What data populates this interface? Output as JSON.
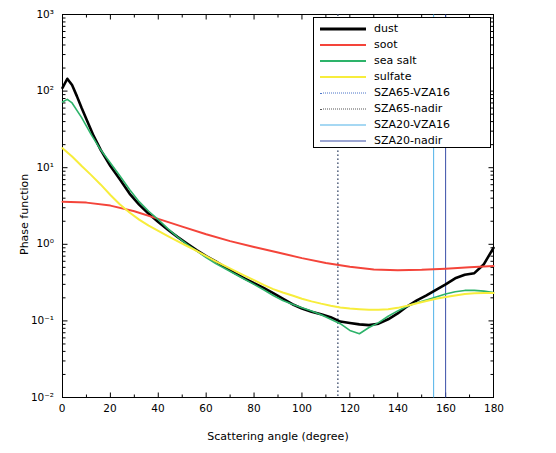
{
  "chart_data": {
    "type": "line",
    "title": "",
    "xlabel": "Scattering angle (degree)",
    "ylabel": "Phase function",
    "xlim": [
      0,
      180
    ],
    "ylim": [
      0.01,
      1000
    ],
    "yscale": "log",
    "xticks": [
      0,
      20,
      40,
      60,
      80,
      100,
      120,
      140,
      160,
      180
    ],
    "xtick_labels": [
      "0",
      "20",
      "40",
      "60",
      "80",
      "100",
      "120",
      "140",
      "160",
      "180"
    ],
    "yticks": [
      0.01,
      0.1,
      1,
      10,
      100,
      1000
    ],
    "ytick_labels": [
      "10⁻²",
      "10⁻¹",
      "10⁰",
      "10¹",
      "10²",
      "10³"
    ],
    "grid": false,
    "legend_position": "top-right",
    "series": [
      {
        "name": "dust",
        "color": "#000000",
        "width": 2.6,
        "x": [
          0,
          2,
          4,
          6,
          8,
          10,
          13,
          16,
          20,
          24,
          28,
          32,
          36,
          40,
          44,
          48,
          52,
          56,
          60,
          64,
          68,
          72,
          76,
          80,
          84,
          88,
          92,
          96,
          100,
          104,
          108,
          112,
          116,
          120,
          124,
          128,
          132,
          136,
          140,
          144,
          148,
          152,
          156,
          160,
          164,
          168,
          172,
          176,
          180
        ],
        "y": [
          110,
          145,
          120,
          86,
          60,
          43,
          26,
          17,
          10.5,
          7.0,
          4.6,
          3.3,
          2.5,
          1.95,
          1.55,
          1.25,
          1.02,
          0.84,
          0.7,
          0.6,
          0.5,
          0.42,
          0.36,
          0.31,
          0.27,
          0.23,
          0.195,
          0.165,
          0.145,
          0.132,
          0.122,
          0.112,
          0.098,
          0.094,
          0.09,
          0.088,
          0.092,
          0.105,
          0.125,
          0.155,
          0.185,
          0.215,
          0.255,
          0.3,
          0.36,
          0.4,
          0.42,
          0.55,
          0.9
        ]
      },
      {
        "name": "soot",
        "color": "#f4443a",
        "width": 2.0,
        "x": [
          0,
          10,
          20,
          30,
          40,
          50,
          60,
          70,
          80,
          90,
          100,
          110,
          120,
          130,
          140,
          150,
          160,
          170,
          180
        ],
        "y": [
          3.6,
          3.5,
          3.2,
          2.7,
          2.15,
          1.7,
          1.35,
          1.1,
          0.92,
          0.78,
          0.66,
          0.57,
          0.51,
          0.47,
          0.46,
          0.465,
          0.48,
          0.5,
          0.52
        ]
      },
      {
        "name": "sea salt",
        "color": "#2db36a",
        "width": 1.6,
        "x": [
          0,
          2,
          4,
          8,
          12,
          16,
          20,
          24,
          28,
          32,
          36,
          40,
          44,
          48,
          52,
          56,
          60,
          64,
          68,
          72,
          76,
          80,
          84,
          88,
          92,
          96,
          100,
          104,
          108,
          112,
          116,
          120,
          124,
          128,
          132,
          136,
          140,
          144,
          148,
          152,
          156,
          160,
          164,
          168,
          172,
          176,
          180
        ],
        "y": [
          72,
          78,
          70,
          45,
          27,
          17,
          11.5,
          7.8,
          5.2,
          3.6,
          2.7,
          2.1,
          1.6,
          1.25,
          1.0,
          0.82,
          0.67,
          0.56,
          0.48,
          0.41,
          0.35,
          0.3,
          0.255,
          0.215,
          0.185,
          0.165,
          0.148,
          0.135,
          0.12,
          0.105,
          0.092,
          0.075,
          0.068,
          0.082,
          0.095,
          0.115,
          0.135,
          0.155,
          0.172,
          0.188,
          0.205,
          0.225,
          0.24,
          0.25,
          0.25,
          0.245,
          0.235
        ]
      },
      {
        "name": "sulfate",
        "color": "#f7ed3c",
        "width": 2.0,
        "x": [
          0,
          4,
          8,
          12,
          16,
          20,
          24,
          28,
          32,
          36,
          40,
          44,
          48,
          52,
          56,
          60,
          64,
          68,
          72,
          76,
          80,
          84,
          88,
          92,
          96,
          100,
          104,
          108,
          112,
          116,
          120,
          124,
          128,
          132,
          136,
          140,
          144,
          148,
          152,
          156,
          160,
          164,
          168,
          172,
          176,
          180
        ],
        "y": [
          18,
          14,
          10.5,
          8.0,
          6.0,
          4.4,
          3.3,
          2.6,
          2.1,
          1.75,
          1.5,
          1.28,
          1.1,
          0.95,
          0.82,
          0.7,
          0.6,
          0.52,
          0.45,
          0.39,
          0.34,
          0.295,
          0.26,
          0.235,
          0.215,
          0.195,
          0.18,
          0.168,
          0.158,
          0.15,
          0.145,
          0.142,
          0.14,
          0.14,
          0.142,
          0.148,
          0.158,
          0.17,
          0.182,
          0.195,
          0.205,
          0.215,
          0.225,
          0.23,
          0.232,
          0.232
        ]
      }
    ],
    "vlines": [
      {
        "name": "SZA65-VZA16",
        "x": 115,
        "color": "#4a74c8",
        "style": "dotted"
      },
      {
        "name": "SZA65-nadir",
        "x": 115,
        "color": "#555555",
        "style": "dotted"
      },
      {
        "name": "SZA20-VZA16",
        "x": 155,
        "color": "#4fb2e8",
        "style": "solid"
      },
      {
        "name": "SZA20-nadir",
        "x": 160,
        "color": "#3a4fa8",
        "style": "solid"
      }
    ]
  },
  "legend": {
    "items": [
      {
        "label": "dust"
      },
      {
        "label": "soot"
      },
      {
        "label": "sea salt"
      },
      {
        "label": "sulfate"
      },
      {
        "label": "SZA65-VZA16"
      },
      {
        "label": "SZA65-nadir"
      },
      {
        "label": "SZA20-VZA16"
      },
      {
        "label": "SZA20-nadir"
      }
    ]
  }
}
